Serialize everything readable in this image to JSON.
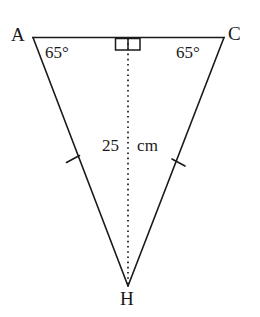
{
  "figure": {
    "type": "geometry-diagram",
    "shape": "isosceles-triangle",
    "stroke_color": "#1a1a1a",
    "background_color": "#ffffff"
  },
  "vertices": {
    "a": {
      "label": "A",
      "x": 33,
      "y": 37
    },
    "c": {
      "label": "C",
      "x": 224,
      "y": 37
    },
    "h": {
      "label": "H",
      "x": 128,
      "y": 286
    }
  },
  "angles": {
    "at_a": {
      "label": "65°",
      "value": 65,
      "unit": "degrees"
    },
    "at_c": {
      "label": "65°",
      "value": 65,
      "unit": "degrees"
    },
    "at_foot": {
      "label": "right-angle",
      "value": 90,
      "unit": "degrees"
    }
  },
  "measurements": {
    "altitude": {
      "number": "25",
      "unit": "cm",
      "full_label": "25 cm",
      "value": 25
    }
  },
  "marks": {
    "congruent_sides_tick_count": 1,
    "right_angle_marker": "double-square"
  }
}
